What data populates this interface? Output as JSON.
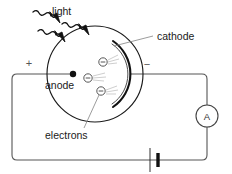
{
  "figure": {
    "background_color": "#ffffff",
    "stroke_color": "#1a1a1a",
    "wire_color": "#555555",
    "labels": {
      "light": "light",
      "cathode": "cathode",
      "anode": "anode",
      "electrons": "electrons",
      "plus": "+",
      "minus": "−",
      "ammeter": "A"
    }
  },
  "components": {
    "tube": {
      "name": "evacuated glass tube",
      "shape": "circle",
      "cx": 95,
      "cy": 74,
      "r": 48
    },
    "anode": {
      "name": "anode",
      "cx": 73,
      "cy": 74,
      "r": 3.2,
      "polarity": "+"
    },
    "cathode": {
      "name": "cathode",
      "shape": "arc",
      "polarity": "−"
    },
    "ammeter": {
      "name": "ammeter",
      "cx": 207,
      "cy": 116,
      "r": 11,
      "letter": "A"
    },
    "battery": {
      "name": "battery",
      "x": 150,
      "y": 160
    }
  },
  "electrons": [
    {
      "cx": 103,
      "cy": 62,
      "r": 4.2,
      "charge": "−"
    },
    {
      "cx": 88,
      "cy": 78,
      "r": 4.2,
      "charge": "−"
    },
    {
      "cx": 101,
      "cy": 91,
      "r": 4.2,
      "charge": "−"
    }
  ],
  "light_rays": [
    {
      "id": 1,
      "angle": 45
    },
    {
      "id": 2,
      "angle": 45
    },
    {
      "id": 3,
      "angle": 45
    }
  ]
}
